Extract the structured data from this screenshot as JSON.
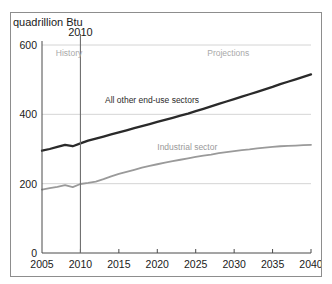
{
  "chart_data": {
    "type": "line",
    "title": "quadrillion Btu",
    "xlabel": "",
    "ylabel": "quadrillion Btu",
    "xlim": [
      2005,
      2040
    ],
    "ylim": [
      0,
      600
    ],
    "xticks": [
      "2005",
      "2010",
      "2015",
      "2020",
      "2025",
      "2030",
      "2035",
      "2040"
    ],
    "yticks": [
      "0",
      "200",
      "400",
      "600"
    ],
    "grid": true,
    "legend_position": "inline-annotations",
    "annotations": [
      {
        "name": "history",
        "text": "History",
        "x": 2006.8,
        "y": 567
      },
      {
        "name": "projections",
        "text": "Projections",
        "x": 2026.5,
        "y": 567
      },
      {
        "name": "divider-year",
        "text": "2010",
        "x": 2010,
        "y": 625
      },
      {
        "name": "all-other-label",
        "text": "All other end-use sectors",
        "x": 2013.2,
        "y": 432
      },
      {
        "name": "industrial-label",
        "text": "Industrial sector",
        "x": 2020.0,
        "y": 298
      }
    ],
    "divider": {
      "x": 2010,
      "label": "2010"
    },
    "colors": {
      "all_other": "#2a2a2a",
      "industrial": "#9a9a9a",
      "grid": "#c9c9c9",
      "axis": "#4a4a4a"
    },
    "x": [
      2005,
      2006,
      2007,
      2008,
      2009,
      2010,
      2011,
      2012,
      2013,
      2014,
      2015,
      2016,
      2017,
      2018,
      2019,
      2020,
      2021,
      2022,
      2023,
      2024,
      2025,
      2026,
      2027,
      2028,
      2029,
      2030,
      2031,
      2032,
      2033,
      2034,
      2035,
      2036,
      2037,
      2038,
      2039,
      2040
    ],
    "series": [
      {
        "name": "All other end-use sectors",
        "color": "#2a2a2a",
        "values": [
          295,
          300,
          306,
          312,
          308,
          316,
          324,
          330,
          336,
          342,
          348,
          354,
          360,
          366,
          372,
          378,
          384,
          390,
          396,
          402,
          409,
          416,
          423,
          430,
          437,
          444,
          451,
          458,
          465,
          472,
          479,
          487,
          494,
          501,
          508,
          515
        ]
      },
      {
        "name": "Industrial sector",
        "color": "#9a9a9a",
        "values": [
          183,
          187,
          191,
          196,
          190,
          199,
          202,
          206,
          213,
          221,
          228,
          234,
          240,
          246,
          251,
          256,
          261,
          265,
          269,
          273,
          277,
          281,
          284,
          288,
          291,
          294,
          297,
          299,
          302,
          304,
          306,
          308,
          309,
          310,
          311,
          312
        ]
      }
    ]
  },
  "figure": {
    "background_color": "#ffffff",
    "border_color": "#8d8d8d"
  }
}
